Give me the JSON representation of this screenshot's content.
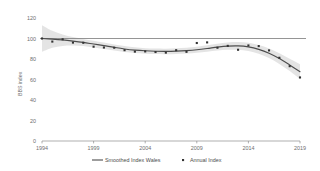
{
  "chart_data": {
    "type": "line",
    "title": "",
    "xlabel": "",
    "ylabel": "BBS index",
    "xlim": [
      1994,
      2019
    ],
    "ylim": [
      0,
      120
    ],
    "yticks": [
      0,
      20,
      40,
      60,
      80,
      100,
      120
    ],
    "xticks": [
      1994,
      1999,
      2004,
      2009,
      2014,
      2019
    ],
    "grid": false,
    "legend_position": "bottom",
    "reference_line": {
      "value": 100,
      "label": "100"
    },
    "x": [
      1994,
      1995,
      1996,
      1997,
      1998,
      1999,
      2000,
      2001,
      2002,
      2003,
      2004,
      2005,
      2006,
      2007,
      2008,
      2009,
      2010,
      2011,
      2012,
      2013,
      2014,
      2015,
      2016,
      2017,
      2018,
      2019
    ],
    "series": [
      {
        "name": "Smoothed Index Wales",
        "type": "line",
        "color": "#4d4d4d",
        "values": [
          100.0,
          99.4,
          98.6,
          97.5,
          96.2,
          94.6,
          93.0,
          91.3,
          89.8,
          88.7,
          88.0,
          87.6,
          87.5,
          87.7,
          88.2,
          89.0,
          90.2,
          91.6,
          92.6,
          92.8,
          91.8,
          89.4,
          85.6,
          80.4,
          74.2,
          67.6
        ]
      },
      {
        "name": "Annual Index",
        "type": "scatter",
        "color": "#333333",
        "marker": "square",
        "values": [
          100.0,
          97.0,
          99.2,
          96.0,
          95.8,
          92.0,
          91.2,
          91.0,
          88.6,
          87.2,
          87.4,
          86.8,
          86.2,
          88.6,
          87.0,
          95.6,
          96.2,
          91.0,
          92.8,
          89.0,
          93.2,
          92.6,
          88.4,
          81.2,
          73.0,
          62.0
        ]
      }
    ],
    "confidence_band": {
      "name": "confidence interval",
      "color": "#d9d9d9",
      "upper": [
        113.0,
        107.5,
        104.0,
        101.5,
        99.6,
        97.8,
        96.0,
        94.2,
        92.6,
        91.4,
        90.6,
        90.2,
        90.1,
        90.4,
        91.0,
        92.0,
        93.4,
        95.0,
        96.2,
        96.6,
        95.8,
        93.6,
        90.2,
        85.6,
        80.2,
        74.8
      ],
      "lower": [
        87.0,
        91.0,
        92.8,
        93.2,
        92.6,
        91.2,
        89.8,
        88.2,
        86.8,
        85.8,
        85.2,
        84.8,
        84.7,
        84.9,
        85.3,
        86.0,
        87.0,
        88.2,
        89.0,
        89.0,
        87.8,
        85.2,
        81.0,
        75.2,
        68.2,
        60.4
      ]
    }
  },
  "axis": {
    "y_title": "BBS index",
    "y_tick_labels": [
      "120",
      "100",
      "80",
      "60",
      "40",
      "20",
      "0"
    ],
    "x_tick_labels": [
      "1994",
      "1999",
      "2004",
      "2009",
      "2014",
      "2019"
    ]
  },
  "legend": {
    "items": [
      {
        "label": "Smoothed Index Wales",
        "marker": "line",
        "color": "#4d4d4d"
      },
      {
        "label": "Annual Index",
        "marker": "square",
        "color": "#333333"
      }
    ]
  }
}
